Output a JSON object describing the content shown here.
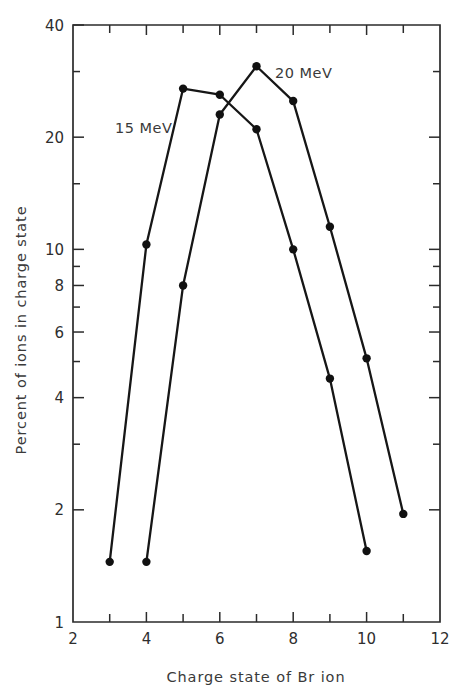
{
  "chart_data": {
    "type": "line",
    "title": "",
    "xlabel": "Charge state of Br ion",
    "ylabel": "Percent of ions in charge state",
    "xlim": [
      2,
      12
    ],
    "ylim": [
      1,
      40
    ],
    "yscale": "log",
    "xscale": "linear",
    "grid": false,
    "legend": "inline-annotations",
    "x_tick_labels": [
      "2",
      "4",
      "6",
      "8",
      "10",
      "12"
    ],
    "x_tick_values": [
      2,
      4,
      6,
      8,
      10,
      12
    ],
    "x_minor_ticks": [
      3,
      5,
      7,
      9,
      11
    ],
    "y_tick_labels": [
      "1",
      "2",
      "4",
      "6",
      "8",
      "10",
      "20",
      "40"
    ],
    "y_tick_values": [
      1,
      2,
      4,
      6,
      8,
      10,
      20,
      40
    ],
    "y_minor_ticks": [
      3,
      5,
      7,
      9,
      15,
      30
    ],
    "series": [
      {
        "name": "15 MeV",
        "annotation": "15 MeV",
        "x": [
          3,
          4,
          5,
          6,
          7,
          8,
          9,
          10
        ],
        "values": [
          1.45,
          10.3,
          27.0,
          26.0,
          21.0,
          10.0,
          4.5,
          1.55
        ]
      },
      {
        "name": "20 MeV",
        "annotation": "20 MeV",
        "x": [
          4,
          5,
          6,
          7,
          8,
          9,
          10,
          11
        ],
        "values": [
          1.45,
          8.0,
          23.0,
          31.0,
          25.0,
          11.5,
          5.1,
          1.95
        ]
      }
    ]
  },
  "colors": {
    "line": "#161616",
    "marker": "#111111",
    "axis": "#2b2b2b",
    "text": "#2e2e2e",
    "background": "#ffffff"
  },
  "annotations": {
    "series_15": "15 MeV",
    "series_20": "20 MeV"
  },
  "axes": {
    "x_label": "Charge state of Br ion",
    "y_label": "Percent of ions in charge state"
  }
}
